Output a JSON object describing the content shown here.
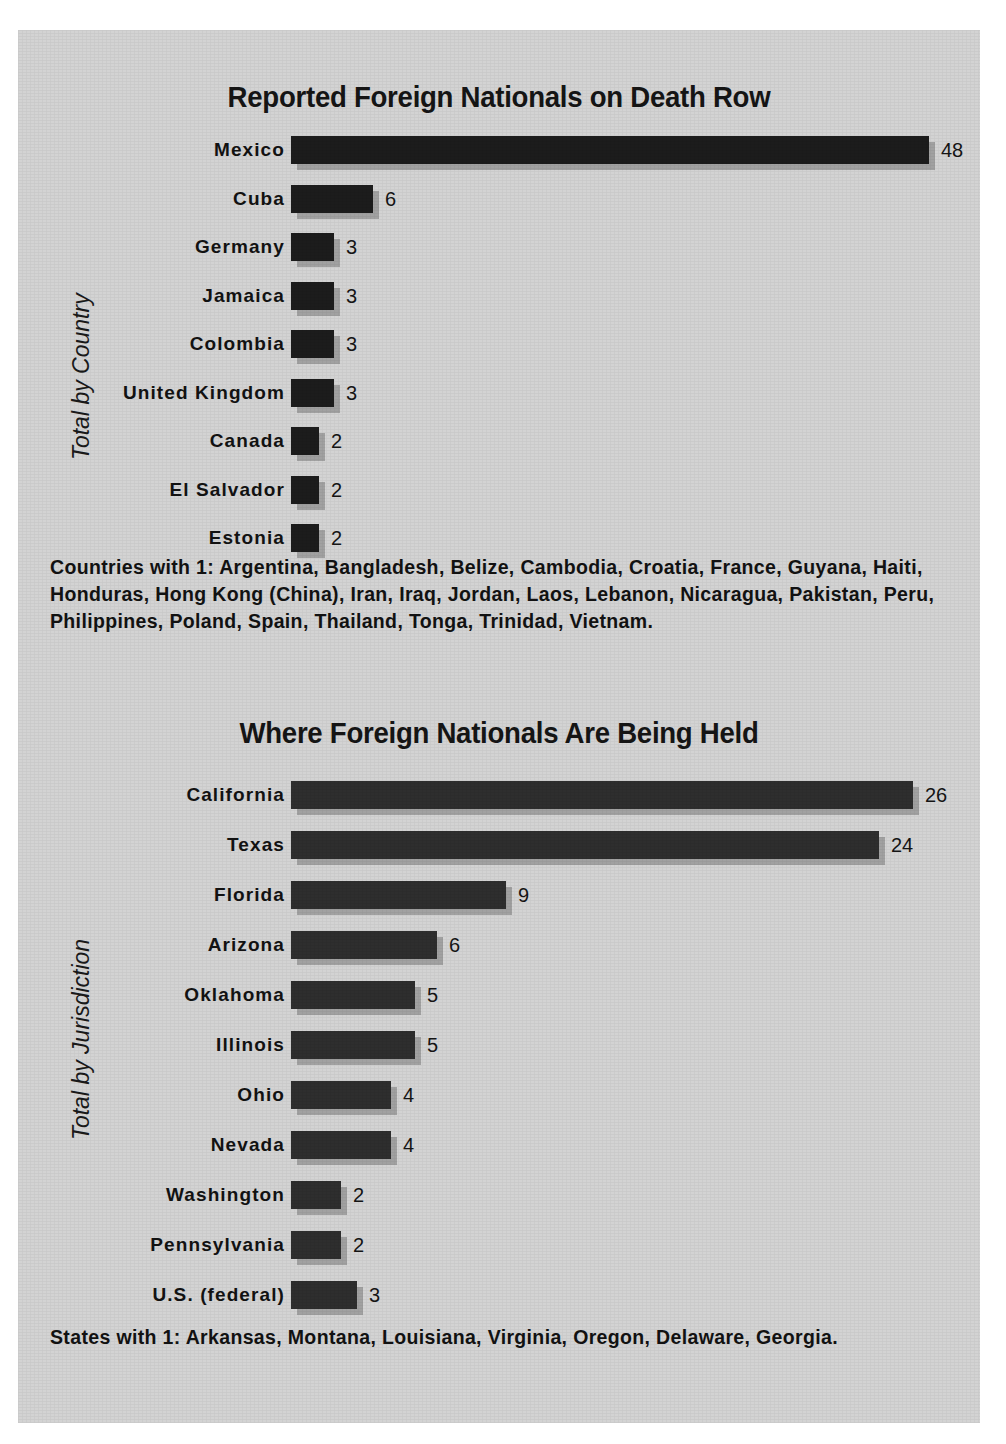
{
  "page": {
    "background_color": "#d3d3d3",
    "bar_color": "#1c1c1c",
    "text_color": "#121212"
  },
  "chart_data": [
    {
      "type": "bar",
      "orientation": "horizontal",
      "title": "Reported Foreign Nationals on Death Row",
      "ylabel": "Total by Country",
      "xlabel": "",
      "grid": false,
      "legend": "none",
      "xlim": [
        0,
        48
      ],
      "categories": [
        "Mexico",
        "Cuba",
        "Germany",
        "Jamaica",
        "Colombia",
        "United Kingdom",
        "Canada",
        "El Salvador",
        "Estonia"
      ],
      "values": [
        48,
        6,
        3,
        3,
        3,
        3,
        2,
        2,
        2
      ],
      "value_labels": [
        "48",
        "6",
        "3",
        "3",
        "3",
        "3",
        "2",
        "2",
        "2"
      ],
      "note": "Countries with 1: Argentina, Bangladesh, Belize, Cambodia, Croatia, France, Guyana, Haiti, Honduras, Hong Kong (China), Iran, Iraq, Jordan, Laos, Lebanon, Nicaragua, Pakistan, Peru, Philippines, Poland, Spain, Thailand, Tonga, Trinidad, Vietnam."
    },
    {
      "type": "bar",
      "orientation": "horizontal",
      "title": "Where Foreign Nationals Are Being Held",
      "ylabel": "Total by Jurisdiction",
      "xlabel": "",
      "grid": false,
      "legend": "none",
      "xlim": [
        0,
        26
      ],
      "categories": [
        "California",
        "Texas",
        "Florida",
        "Arizona",
        "Oklahoma",
        "Illinois",
        "Ohio",
        "Nevada",
        "Washington",
        "Pennsylvania",
        "U.S. (federal)"
      ],
      "values": [
        26,
        24,
        9,
        6,
        5,
        5,
        4,
        4,
        2,
        2,
        3
      ],
      "value_labels": [
        "26",
        "24",
        "9",
        "6",
        "5",
        "5",
        "4",
        "4",
        "2",
        "2",
        "3"
      ],
      "note": "States with 1: Arkansas, Montana, Louisiana, Virginia, Oregon, Delaware, Georgia."
    }
  ],
  "chart1": {
    "title": "Reported Foreign Nationals on Death Row",
    "axis_label": "Total by Country",
    "rows": [
      {
        "label": "Mexico",
        "value": "48",
        "bar_px": 638
      },
      {
        "label": "Cuba",
        "value": "6",
        "bar_px": 82
      },
      {
        "label": "Germany",
        "value": "3",
        "bar_px": 43
      },
      {
        "label": "Jamaica",
        "value": "3",
        "bar_px": 43
      },
      {
        "label": "Colombia",
        "value": "3",
        "bar_px": 43
      },
      {
        "label": "United Kingdom",
        "value": "3",
        "bar_px": 43
      },
      {
        "label": "Canada",
        "value": "2",
        "bar_px": 28
      },
      {
        "label": "El Salvador",
        "value": "2",
        "bar_px": 28
      },
      {
        "label": "Estonia",
        "value": "2",
        "bar_px": 28
      }
    ],
    "note": "Countries with 1: Argentina, Bangladesh, Belize, Cambodia, Croatia, France, Guyana, Haiti, Honduras, Hong Kong (China), Iran, Iraq, Jordan, Laos, Lebanon, Nicaragua, Pakistan, Peru, Philippines, Poland, Spain, Thailand, Tonga, Trinidad, Vietnam."
  },
  "chart2": {
    "title": "Where Foreign Nationals Are Being Held",
    "axis_label": "Total by Jurisdiction",
    "rows": [
      {
        "label": "California",
        "value": "26",
        "bar_px": 622
      },
      {
        "label": "Texas",
        "value": "24",
        "bar_px": 588
      },
      {
        "label": "Florida",
        "value": "9",
        "bar_px": 215
      },
      {
        "label": "Arizona",
        "value": "6",
        "bar_px": 146
      },
      {
        "label": "Oklahoma",
        "value": "5",
        "bar_px": 124
      },
      {
        "label": "Illinois",
        "value": "5",
        "bar_px": 124
      },
      {
        "label": "Ohio",
        "value": "4",
        "bar_px": 100
      },
      {
        "label": "Nevada",
        "value": "4",
        "bar_px": 100
      },
      {
        "label": "Washington",
        "value": "2",
        "bar_px": 50
      },
      {
        "label": "Pennsylvania",
        "value": "2",
        "bar_px": 50
      },
      {
        "label": "U.S. (federal)",
        "value": "3",
        "bar_px": 66
      }
    ],
    "note": "States with 1: Arkansas, Montana, Louisiana, Virginia, Oregon, Delaware, Georgia."
  }
}
